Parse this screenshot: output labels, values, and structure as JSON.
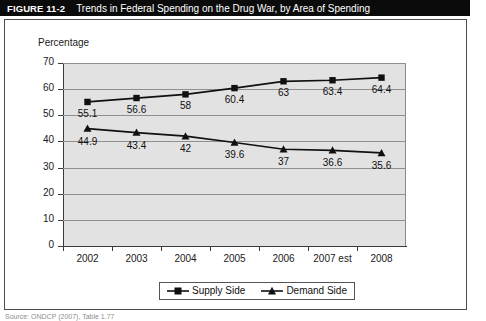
{
  "figure": {
    "number": "FIGURE 11-2",
    "caption": "Trends in Federal Spending on the Drug War, by Area of Spending",
    "source_note": "Source: ONDCP (2007), Table 1.77"
  },
  "colors": {
    "title_bar_background": "#0b0b0b",
    "title_bar_text": "#ffffff",
    "plot_background": "#e2e2e2",
    "gridline": "#8f8f8f",
    "axis": "#3a3a3a",
    "series_line": "#101010",
    "frame_border": "#4d4d4d"
  },
  "legend": {
    "position": "bottom-center",
    "entries": [
      {
        "label": "Supply Side",
        "marker": "square-marker"
      },
      {
        "label": "Demand Side",
        "marker": "triangle-marker"
      }
    ]
  },
  "chart_data": {
    "type": "line",
    "title": "Trends in Federal Spending on the Drug War, by Area of Spending",
    "xlabel": "",
    "ylabel": "Percentage",
    "ylim": [
      0,
      70
    ],
    "yticks": [
      0,
      10,
      20,
      30,
      40,
      50,
      60,
      70
    ],
    "grid": true,
    "categories": [
      "2002",
      "2003",
      "2004",
      "2005",
      "2006",
      "2007 est",
      "2008"
    ],
    "series": [
      {
        "name": "Supply Side",
        "marker": "square-marker",
        "values": [
          55.1,
          56.6,
          58,
          60.4,
          63,
          63.4,
          64.4
        ],
        "labels": [
          "55.1",
          "56.6",
          "58",
          "60.4",
          "63",
          "63.4",
          "64.4"
        ]
      },
      {
        "name": "Demand Side",
        "marker": "triangle-marker",
        "values": [
          44.9,
          43.4,
          42,
          39.6,
          37,
          36.6,
          35.6
        ],
        "labels": [
          "44.9",
          "43.4",
          "42",
          "39.6",
          "37",
          "36.6",
          "35.6"
        ]
      }
    ]
  }
}
